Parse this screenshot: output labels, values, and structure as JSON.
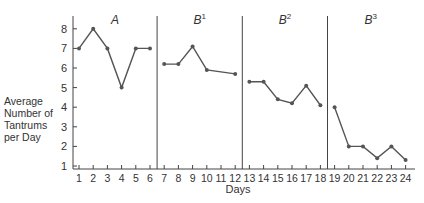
{
  "chart_data": {
    "type": "line",
    "title": "",
    "xlabel": "Days",
    "ylabel": "Average Number of Tantrums per Day",
    "ylabel_lines": [
      "Average",
      "Number of",
      "Tantrums",
      "per Day"
    ],
    "ylim": [
      1,
      8
    ],
    "yticks": [
      1,
      2,
      3,
      4,
      5,
      6,
      7,
      8
    ],
    "xticks": [
      1,
      2,
      3,
      4,
      5,
      6,
      7,
      8,
      9,
      10,
      11,
      12,
      13,
      14,
      15,
      16,
      17,
      18,
      19,
      20,
      21,
      22,
      23,
      24
    ],
    "grid": false,
    "legend": null,
    "phase_change_lines_after_day": [
      6.5,
      12.5,
      18.5
    ],
    "phases": [
      {
        "name": "A",
        "sup": "",
        "days": [
          1,
          2,
          3,
          4,
          5,
          6
        ],
        "values": [
          7,
          8,
          7,
          5,
          7,
          7
        ]
      },
      {
        "name": "B",
        "sup": "1",
        "days": [
          7,
          8,
          9,
          10,
          12
        ],
        "values": [
          6.2,
          6.2,
          7.1,
          5.9,
          5.7
        ]
      },
      {
        "name": "B",
        "sup": "2",
        "days": [
          13,
          14,
          15,
          16,
          17,
          18
        ],
        "values": [
          5.3,
          5.3,
          4.4,
          4.2,
          5.1,
          4.1
        ]
      },
      {
        "name": "B",
        "sup": "3",
        "days": [
          19,
          20,
          21,
          22,
          23,
          24
        ],
        "values": [
          4.0,
          2.0,
          2.0,
          1.4,
          2.0,
          1.3
        ]
      }
    ]
  },
  "labels": {
    "xlabel": "Days",
    "ylabel_lines": [
      "Average",
      "Number of",
      "Tantrums",
      "per Day"
    ]
  },
  "colors": {
    "line": "#555555",
    "axis": "#444444",
    "text": "#333333"
  }
}
